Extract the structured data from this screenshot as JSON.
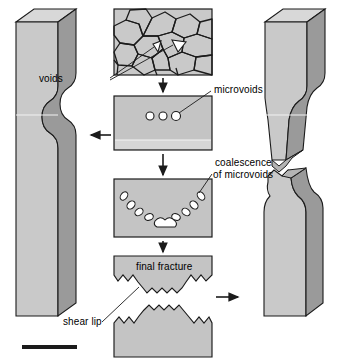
{
  "figure": {
    "background": "#ffffff",
    "width": 343,
    "height": 359
  },
  "colors": {
    "specimen_face": "#c9c9c9",
    "specimen_side": "#9a9a9a",
    "specimen_top": "#d8d8d8",
    "panel_fill": "#c4c4c4",
    "panel_band": "#d6d6d6",
    "grain_fill": "#c9c9c9",
    "void_fill": "#ffffff",
    "outline": "#1b1b1b",
    "text": "#000000",
    "scalebar": "#1b1b1b"
  },
  "labels": {
    "voids": "voids",
    "microvoids": "microvoids",
    "coalescence_line1": "coalescence",
    "coalescence_line2": "of microvoids",
    "final_fracture": "final fracture",
    "shear_lip": "shear lip"
  },
  "panels": [
    {
      "id": "grain-structure-panel",
      "name": "grain-structure-panel",
      "stage": 1,
      "description": "polygonal grain microstructure with two triangular voids at grain boundaries",
      "void_count": 2
    },
    {
      "id": "microvoids-panel",
      "name": "microvoids-panel",
      "stage": 2,
      "description": "uniform section with three small circular microvoids near center",
      "void_count": 3
    },
    {
      "id": "coalescence-panel",
      "name": "coalescence-panel",
      "stage": 3,
      "description": "elongated voids arranged in a U-shaped arc coalescing into a central crack",
      "void_count": 11
    },
    {
      "id": "final-fracture-panel",
      "name": "final-fracture-panel",
      "stage": 4,
      "description": "cup-and-cone fracture separating into two halves with serrated shear lips"
    }
  ],
  "specimens": [
    {
      "id": "left-specimen",
      "name": "necked-specimen",
      "state": "necked, intact",
      "side": "left"
    },
    {
      "id": "right-specimen",
      "name": "fractured-specimen",
      "state": "fractured, separated into two halves",
      "side": "right"
    }
  ],
  "arrows": [
    {
      "name": "arrow-stage1-to-stage2",
      "direction": "down"
    },
    {
      "name": "arrow-stage2-to-stage3",
      "direction": "down"
    },
    {
      "name": "arrow-stage3-to-stage4",
      "direction": "down"
    },
    {
      "name": "arrow-to-left-specimen",
      "direction": "left"
    },
    {
      "name": "arrow-to-right-specimen",
      "direction": "right"
    }
  ],
  "scalebar": {
    "name": "scale-bar",
    "visible": true
  }
}
